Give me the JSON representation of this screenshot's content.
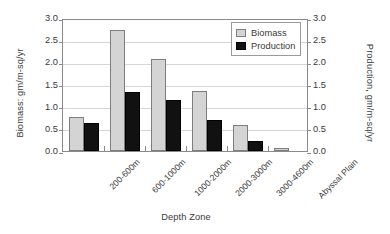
{
  "chart_data": {
    "type": "bar",
    "title": "",
    "xlabel": "Depth Zone",
    "ylabel": "Biomass: gm/m-sq/yr",
    "ylabel_right": "Production, gm/m-sq/yr",
    "categories": [
      "200-600m",
      "600-1000m",
      "1000-2000m",
      "2000-3000m",
      "3000-4600m",
      "Abyssal Plain"
    ],
    "series": [
      {
        "name": "Biomass",
        "values": [
          0.76,
          2.72,
          2.08,
          1.35,
          0.58,
          0.06
        ],
        "color": "#d4d4d4"
      },
      {
        "name": "Production",
        "values": [
          0.63,
          1.32,
          1.16,
          0.7,
          0.22,
          0.0
        ],
        "color": "#111111"
      }
    ],
    "ylim": [
      0.0,
      3.0
    ],
    "ylim_right": [
      0.0,
      3.0
    ],
    "yticks": [
      "0.0",
      "0.5",
      "1.0",
      "1.5",
      "2.0",
      "2.5",
      "3.0"
    ],
    "yticks_right": [
      "0.0",
      "0.5",
      "1.0",
      "1.5",
      "2.0",
      "2.5",
      "3.0"
    ],
    "grid": "horizontal",
    "legend_position": "top-right",
    "legend": [
      "Biomass",
      "Production"
    ]
  }
}
